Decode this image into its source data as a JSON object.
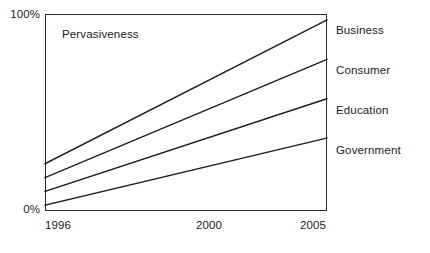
{
  "chart_data": {
    "type": "line",
    "title": "",
    "annotation": "Pervasiveness",
    "xlabel": "",
    "ylabel": "",
    "x": [
      1996,
      2005
    ],
    "xlim": [
      1996,
      2005
    ],
    "ylim": [
      0,
      100
    ],
    "x_tick_labels": [
      "1996",
      "2000",
      "2005"
    ],
    "x_tick_values": [
      1996,
      2000,
      2005
    ],
    "y_tick_labels": [
      "0%",
      "100%"
    ],
    "y_tick_values": [
      0,
      100
    ],
    "grid": false,
    "legend_position": "right-of-axes-inline",
    "series": [
      {
        "name": "Business",
        "values": [
          24,
          97
        ],
        "label_y_pct": 30
      },
      {
        "name": "Consumer",
        "values": [
          17,
          77
        ],
        "label_y_pct": 70
      },
      {
        "name": "Education",
        "values": [
          10,
          57
        ],
        "label_y_pct": 110
      },
      {
        "name": "Government",
        "values": [
          3,
          37
        ],
        "label_y_pct": 150
      }
    ],
    "line_color": "#1c1c1c"
  },
  "axes": {
    "y_top_label": "100%",
    "y_bottom_label": "0%",
    "x_labels": {
      "left": "1996",
      "middle": "2000",
      "right": "2005"
    }
  },
  "labels": {
    "business": "Business",
    "consumer": "Consumer",
    "education": "Education",
    "government": "Government",
    "annotation": "Pervasiveness"
  }
}
